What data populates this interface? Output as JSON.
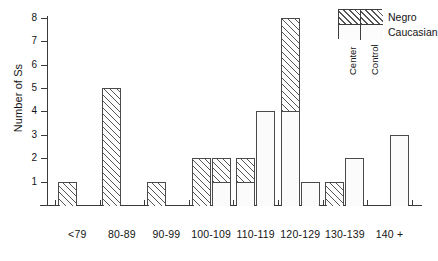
{
  "chart_data": {
    "type": "bar",
    "title": "",
    "subtitle": "",
    "xlabel": "",
    "ylabel": "Number of Ss",
    "ylim": [
      0,
      8
    ],
    "yticks": [
      1,
      2,
      3,
      4,
      5,
      6,
      7,
      8
    ],
    "grid": false,
    "legend_position": "top-right",
    "categories": [
      "<79",
      "80-89",
      "90-99",
      "100-109",
      "110-119",
      "120-129",
      "130-139",
      "140 +"
    ],
    "groups": [
      "Center",
      "Control"
    ],
    "stack_segments": [
      "Caucasian",
      "Negro"
    ],
    "series": [
      {
        "name": "Center - Caucasian",
        "group": "Center",
        "segment": "Caucasian",
        "values": [
          0,
          0,
          0,
          0,
          1,
          4,
          0,
          0
        ]
      },
      {
        "name": "Center - Negro",
        "group": "Center",
        "segment": "Negro",
        "values": [
          1,
          5,
          1,
          2,
          1,
          4,
          1,
          0
        ]
      },
      {
        "name": "Control - Caucasian",
        "group": "Control",
        "segment": "Caucasian",
        "values": [
          0,
          0,
          0,
          1,
          4,
          1,
          2,
          3
        ]
      },
      {
        "name": "Control - Negro",
        "group": "Control",
        "segment": "Negro",
        "values": [
          0,
          0,
          0,
          1,
          0,
          0,
          0,
          0
        ]
      }
    ],
    "bar_totals": {
      "center": [
        1,
        5,
        1,
        2,
        2,
        8,
        1,
        0
      ],
      "control": [
        0,
        0,
        0,
        2,
        4,
        1,
        2,
        3
      ]
    }
  },
  "axes": {
    "y": {
      "title": "Number of Ss",
      "ticks": [
        {
          "value": 8,
          "label": "8"
        },
        {
          "value": 7,
          "label": "7"
        },
        {
          "value": 6,
          "label": "6"
        },
        {
          "value": 5,
          "label": "5"
        },
        {
          "value": 4,
          "label": "4"
        },
        {
          "value": 3,
          "label": "3"
        },
        {
          "value": 2,
          "label": "2"
        },
        {
          "value": 1,
          "label": "1"
        }
      ]
    },
    "x": {
      "labels": [
        "<79",
        "80-89",
        "90-99",
        "100-109",
        "110-119",
        "120-129",
        "130-139",
        "140 +"
      ]
    }
  },
  "legend": {
    "row_labels": [
      "Negro",
      "Caucasian"
    ],
    "column_labels": [
      "Center",
      "Control"
    ]
  },
  "colors": {
    "axis": "#3a3a3a",
    "bar_outline": "#4a4a4a",
    "hatch": "#555555",
    "plain_fill": "#fbfbfb",
    "background": "#ffffff",
    "text": "#141414"
  }
}
